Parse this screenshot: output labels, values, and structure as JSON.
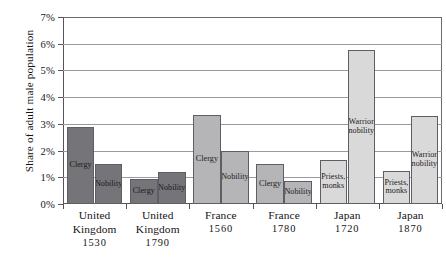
{
  "chart_data": {
    "type": "bar",
    "title": "",
    "xlabel": "",
    "ylabel": "Share of adult male population",
    "ylim": [
      0,
      7
    ],
    "ytick_labels": [
      "0%",
      "1%",
      "2%",
      "3%",
      "4%",
      "5%",
      "6%",
      "7%"
    ],
    "ytick_values": [
      0,
      1,
      2,
      3,
      4,
      5,
      6,
      7
    ],
    "grid": true,
    "legend": "none",
    "categories": [
      "United Kingdom 1530",
      "United Kingdom 1790",
      "France 1560",
      "France 1780",
      "Japan 1720",
      "Japan 1870"
    ],
    "groups": [
      {
        "country": "United",
        "country2": "Kingdom",
        "year": "1530",
        "shade": "dark",
        "bars": [
          {
            "label": "Clergy",
            "value": 2.9
          },
          {
            "label": "Nobility",
            "value": 1.5
          }
        ]
      },
      {
        "country": "United",
        "country2": "Kingdom",
        "year": "1790",
        "shade": "dark",
        "bars": [
          {
            "label": "Clergy",
            "value": 0.95
          },
          {
            "label": "Nobility",
            "value": 1.2
          }
        ]
      },
      {
        "country": "France",
        "country2": "",
        "year": "1560",
        "shade": "mid",
        "bars": [
          {
            "label": "Clergy",
            "value": 3.35
          },
          {
            "label": "Nobility",
            "value": 2.0
          }
        ]
      },
      {
        "country": "France",
        "country2": "",
        "year": "1780",
        "shade": "mid",
        "bars": [
          {
            "label": "Clergy",
            "value": 1.5
          },
          {
            "label": "Nobility",
            "value": 0.85
          }
        ]
      },
      {
        "country": "Japan",
        "country2": "",
        "year": "1720",
        "shade": "light",
        "bars": [
          {
            "label": "Priests,\nmonks",
            "value": 1.65
          },
          {
            "label": "Warrior\nnobility",
            "value": 5.75
          }
        ]
      },
      {
        "country": "Japan",
        "country2": "",
        "year": "1870",
        "shade": "light",
        "bars": [
          {
            "label": "Priests,\nmonks",
            "value": 1.25
          },
          {
            "label": "Warrior\nnobility",
            "value": 3.3
          }
        ]
      }
    ],
    "series": [
      {
        "name": "Clergy / Priests, monks",
        "values": [
          2.9,
          0.95,
          3.35,
          1.5,
          1.65,
          1.25
        ]
      },
      {
        "name": "Nobility / Warrior nobility",
        "values": [
          1.5,
          1.2,
          2.0,
          0.85,
          5.75,
          3.3
        ]
      }
    ]
  },
  "colors": {
    "bar_dark": "#757478",
    "bar_mid": "#b5b4b6",
    "bar_light": "#d9d9d9",
    "bar_border": "#5f5e64",
    "gridline": "#9b9aa0",
    "axis": "#55545a",
    "text": "#141414",
    "background": "#ffffff"
  }
}
